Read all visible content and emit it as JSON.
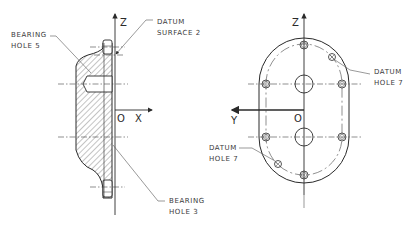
{
  "drawing": {
    "left_view": {
      "axes": {
        "vertical": "Z",
        "horizontal": "X",
        "origin": "O"
      },
      "callouts": [
        {
          "id": "bearing-hole-5",
          "line1": "BEARING",
          "line2": "HOLE 5"
        },
        {
          "id": "datum-surface-2",
          "line1": "DATUM",
          "line2": "SURFACE 2"
        },
        {
          "id": "bearing-hole-3",
          "line1": "BEARING",
          "line2": "HOLE 3"
        }
      ]
    },
    "right_view": {
      "axes": {
        "vertical": "Z",
        "horizontal": "Y",
        "origin": "O"
      },
      "callouts": [
        {
          "id": "datum-hole-7-upper",
          "line1": "DATUM",
          "line2": "HOLE 7"
        },
        {
          "id": "datum-hole-7-lower",
          "line1": "DATUM",
          "line2": "HOLE 7"
        }
      ]
    },
    "colors": {
      "line": "#2a2a2a",
      "background": "#ffffff",
      "hatch": "#555555"
    }
  }
}
